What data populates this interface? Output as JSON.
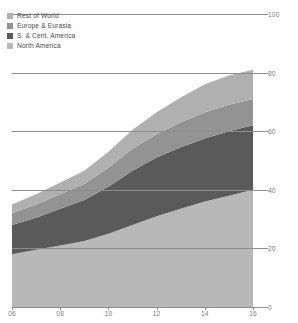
{
  "chart_data": {
    "type": "area",
    "stacked": true,
    "title": "",
    "subtitle": "",
    "xlabel": "",
    "ylabel": "",
    "x": [
      6,
      7,
      8,
      9,
      10,
      11,
      12,
      13,
      14,
      15,
      16
    ],
    "xtick_labels": [
      "06",
      "08",
      "10",
      "12",
      "14",
      "16"
    ],
    "xtick_values": [
      6,
      8,
      10,
      12,
      14,
      16
    ],
    "xlim": [
      6,
      16
    ],
    "ylim": [
      0,
      100
    ],
    "ytick_labels": [
      "100",
      "80",
      "60",
      "40",
      "20",
      "0"
    ],
    "ytick_values": [
      100,
      80,
      60,
      40,
      20,
      0
    ],
    "grid": true,
    "grid_axis": "y",
    "legend_position": "top-left",
    "series": [
      {
        "name": "North America",
        "color": "#b8b8b8",
        "values": [
          18,
          19.5,
          21,
          22.5,
          25,
          28,
          31,
          33.5,
          36,
          38,
          40
        ]
      },
      {
        "name": "S. & Cent. America",
        "color": "#5a5a5a",
        "values": [
          10,
          11,
          12.5,
          14,
          16,
          18.5,
          20,
          21,
          21.5,
          22,
          22
        ]
      },
      {
        "name": "Europe & Eurasia",
        "color": "#939393",
        "values": [
          4,
          4.5,
          5,
          5.5,
          6.5,
          7.5,
          8,
          8.5,
          9,
          9,
          9
        ]
      },
      {
        "name": "Rest of World",
        "color": "#b0b0b0",
        "values": [
          3,
          3.5,
          4,
          4.5,
          5.5,
          6.5,
          7.5,
          8.5,
          9.5,
          10,
          10
        ]
      }
    ],
    "cumulative_top": [
      35,
      38.5,
      42.5,
      46.5,
      53,
      60.5,
      66.5,
      71.5,
      76,
      79,
      81
    ]
  },
  "legend": {
    "items": [
      {
        "label": "Rest of World",
        "color": "#b0b0b0"
      },
      {
        "label": "Europe & Eurasia",
        "color": "#939393"
      },
      {
        "label": "S. & Cent. America",
        "color": "#5a5a5a"
      },
      {
        "label": "North America",
        "color": "#b8b8b8"
      }
    ]
  }
}
